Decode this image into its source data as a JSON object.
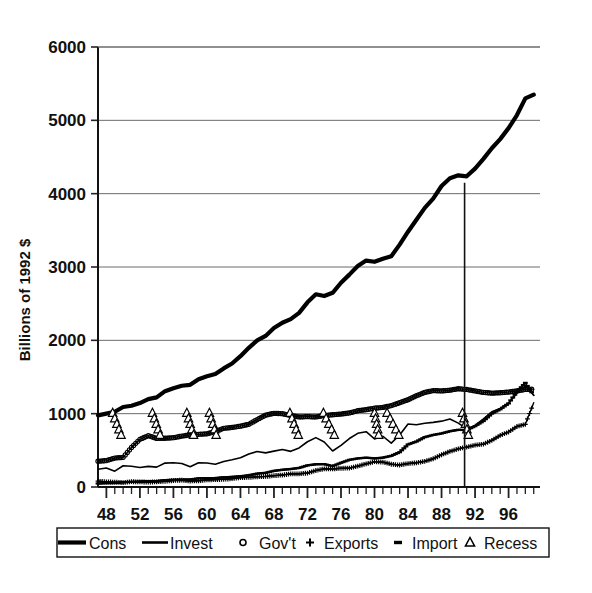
{
  "chart_data": {
    "type": "line",
    "title": "",
    "xlabel": "",
    "ylabel": "Billions of 1992 $",
    "xlim": [
      1947,
      1999.75
    ],
    "ylim": [
      0,
      6000
    ],
    "grid": true,
    "legend_position": "bottom",
    "ytick_labels": [
      "0",
      "1000",
      "2000",
      "3000",
      "4000",
      "5000",
      "6000"
    ],
    "ytick_values": [
      0,
      1000,
      2000,
      3000,
      4000,
      5000,
      6000
    ],
    "xtick_labels": [
      "48",
      "52",
      "56",
      "60",
      "64",
      "68",
      "72",
      "76",
      "80",
      "84",
      "88",
      "92",
      "96"
    ],
    "xtick_values": [
      1948,
      1952,
      1956,
      1960,
      1964,
      1968,
      1972,
      1976,
      1980,
      1984,
      1988,
      1992,
      1996
    ],
    "minor_xtick_interval": 1,
    "annotations": [
      {
        "name": "vertical-marker-line",
        "type": "vline",
        "x": 1990.75,
        "y_top": 4150,
        "y_bottom": 0
      }
    ],
    "series": [
      {
        "name": "Cons",
        "style": "thick-line",
        "marker": "none",
        "color": "#000000",
        "linewidth": 4.2,
        "x": [
          1947,
          1948,
          1949,
          1950,
          1951,
          1952,
          1953,
          1954,
          1955,
          1956,
          1957,
          1958,
          1959,
          1960,
          1961,
          1962,
          1963,
          1964,
          1965,
          1966,
          1967,
          1968,
          1969,
          1970,
          1971,
          1972,
          1973,
          1974,
          1975,
          1976,
          1977,
          1978,
          1979,
          1980,
          1981,
          1982,
          1983,
          1984,
          1985,
          1986,
          1987,
          1988,
          1989,
          1990,
          1991,
          1992,
          1993,
          1994,
          1995,
          1996,
          1997,
          1998,
          1999
        ],
        "values": [
          976,
          1000,
          1026,
          1091,
          1108,
          1144,
          1198,
          1222,
          1307,
          1348,
          1381,
          1393,
          1470,
          1510,
          1541,
          1617,
          1684,
          1784,
          1898,
          1999,
          2060,
          2167,
          2240,
          2290,
          2374,
          2518,
          2628,
          2604,
          2648,
          2785,
          2896,
          3013,
          3088,
          3071,
          3113,
          3147,
          3305,
          3481,
          3645,
          3806,
          3932,
          4105,
          4211,
          4250,
          4237,
          4341,
          4474,
          4619,
          4744,
          4894,
          5072,
          5300,
          5350
        ]
      },
      {
        "name": "Invest",
        "style": "thin-line",
        "marker": "none",
        "color": "#000000",
        "linewidth": 1.6,
        "x": [
          1947,
          1948,
          1949,
          1950,
          1951,
          1952,
          1953,
          1954,
          1955,
          1956,
          1957,
          1958,
          1959,
          1960,
          1961,
          1962,
          1963,
          1964,
          1965,
          1966,
          1967,
          1968,
          1969,
          1970,
          1971,
          1972,
          1973,
          1974,
          1975,
          1976,
          1977,
          1978,
          1979,
          1980,
          1981,
          1982,
          1983,
          1984,
          1985,
          1986,
          1987,
          1988,
          1989,
          1990,
          1991,
          1992,
          1993,
          1994,
          1995,
          1996,
          1997,
          1998,
          1999
        ],
        "values": [
          242,
          258,
          216,
          290,
          282,
          267,
          281,
          271,
          326,
          331,
          321,
          276,
          330,
          327,
          311,
          348,
          371,
          398,
          451,
          484,
          465,
          489,
          512,
          486,
          533,
          617,
          673,
          613,
          491,
          568,
          661,
          732,
          754,
          656,
          692,
          598,
          709,
          860,
          848,
          870,
          881,
          898,
          928,
          871,
          792,
          839,
          929,
          1026,
          1070,
          1144,
          1280,
          1380,
          1250
        ]
      },
      {
        "name": "Gov't",
        "style": "marker-line",
        "marker": "circle",
        "color": "#000000",
        "linewidth": 1.4,
        "x": [
          1947,
          1948,
          1949,
          1950,
          1951,
          1952,
          1953,
          1954,
          1955,
          1956,
          1957,
          1958,
          1959,
          1960,
          1961,
          1962,
          1963,
          1964,
          1965,
          1966,
          1967,
          1968,
          1969,
          1970,
          1971,
          1972,
          1973,
          1974,
          1975,
          1976,
          1977,
          1978,
          1979,
          1980,
          1981,
          1982,
          1983,
          1984,
          1985,
          1986,
          1987,
          1988,
          1989,
          1990,
          1991,
          1992,
          1993,
          1994,
          1995,
          1996,
          1997,
          1998,
          1999
        ],
        "values": [
          352,
          360,
          395,
          404,
          540,
          650,
          700,
          663,
          665,
          672,
          694,
          711,
          718,
          725,
          757,
          800,
          812,
          830,
          855,
          920,
          980,
          1005,
          1000,
          975,
          955,
          960,
          955,
          975,
          985,
          995,
          1010,
          1040,
          1055,
          1075,
          1085,
          1110,
          1150,
          1190,
          1245,
          1290,
          1315,
          1310,
          1320,
          1340,
          1330,
          1310,
          1290,
          1280,
          1285,
          1295,
          1310,
          1330,
          1335
        ]
      },
      {
        "name": "Exports",
        "style": "marker-line",
        "marker": "plus",
        "color": "#000000",
        "linewidth": 1.4,
        "x": [
          1947,
          1948,
          1949,
          1950,
          1951,
          1952,
          1953,
          1954,
          1955,
          1956,
          1957,
          1958,
          1959,
          1960,
          1961,
          1962,
          1963,
          1964,
          1965,
          1966,
          1967,
          1968,
          1969,
          1970,
          1971,
          1972,
          1973,
          1974,
          1975,
          1976,
          1977,
          1978,
          1979,
          1980,
          1981,
          1982,
          1983,
          1984,
          1985,
          1986,
          1987,
          1988,
          1989,
          1990,
          1991,
          1992,
          1993,
          1994,
          1995,
          1996,
          1997,
          1998,
          1999
        ],
        "values": [
          80,
          70,
          66,
          60,
          72,
          70,
          66,
          70,
          78,
          88,
          93,
          82,
          85,
          97,
          100,
          105,
          113,
          128,
          131,
          140,
          144,
          155,
          163,
          178,
          180,
          190,
          225,
          248,
          246,
          255,
          258,
          285,
          315,
          345,
          340,
          310,
          300,
          320,
          330,
          350,
          385,
          440,
          485,
          520,
          545,
          570,
          585,
          635,
          705,
          750,
          825,
          855,
          1150
        ]
      },
      {
        "name": "Import",
        "style": "marker-line",
        "marker": "dash",
        "color": "#000000",
        "linewidth": 1.4,
        "x": [
          1947,
          1948,
          1949,
          1950,
          1951,
          1952,
          1953,
          1954,
          1955,
          1956,
          1957,
          1958,
          1959,
          1960,
          1961,
          1962,
          1963,
          1964,
          1965,
          1966,
          1967,
          1968,
          1969,
          1970,
          1971,
          1972,
          1973,
          1974,
          1975,
          1976,
          1977,
          1978,
          1979,
          1980,
          1981,
          1982,
          1983,
          1984,
          1985,
          1986,
          1987,
          1988,
          1989,
          1990,
          1991,
          1992,
          1993,
          1994,
          1995,
          1996,
          1997,
          1998,
          1999
        ],
        "values": [
          48,
          52,
          54,
          66,
          70,
          74,
          80,
          80,
          92,
          98,
          100,
          102,
          118,
          120,
          122,
          132,
          138,
          146,
          160,
          183,
          193,
          220,
          235,
          245,
          260,
          295,
          310,
          312,
          285,
          330,
          370,
          390,
          400,
          390,
          400,
          425,
          475,
          580,
          620,
          680,
          710,
          730,
          760,
          780,
          775,
          830,
          900,
          1000,
          1060,
          1140,
          1300,
          1420,
          1250
        ]
      },
      {
        "name": "Recess",
        "style": "markers-only",
        "marker": "triangle",
        "color": "#000000",
        "description": "Recession period markers drawn as descending columns of open triangles from ~1000 to ~700",
        "periods": [
          {
            "start": 1948.75,
            "end": 1949.75
          },
          {
            "start": 1953.5,
            "end": 1954.4
          },
          {
            "start": 1957.6,
            "end": 1958.4
          },
          {
            "start": 1960.3,
            "end": 1961.1
          },
          {
            "start": 1969.9,
            "end": 1970.9
          },
          {
            "start": 1973.9,
            "end": 1975.2
          },
          {
            "start": 1980.0,
            "end": 1980.5
          },
          {
            "start": 1981.5,
            "end": 1982.9
          },
          {
            "start": 1990.5,
            "end": 1991.2
          }
        ]
      }
    ],
    "legend": [
      {
        "label": "Cons",
        "marker": "thick-line"
      },
      {
        "label": "Invest",
        "marker": "thin-line"
      },
      {
        "label": "Gov't",
        "marker": "circle"
      },
      {
        "label": "Exports",
        "marker": "plus"
      },
      {
        "label": "Import",
        "marker": "dash"
      },
      {
        "label": "Recess",
        "marker": "triangle"
      }
    ]
  }
}
